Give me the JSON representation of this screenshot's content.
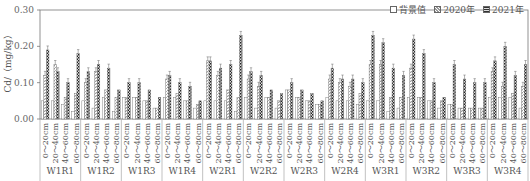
{
  "chart_data": {
    "type": "bar",
    "title": "",
    "ylabel": "Cd/（mg/kg）",
    "xlabel": "",
    "ylim": [
      0,
      0.3
    ],
    "yticks": [
      "0.00",
      "0.10",
      "0.20",
      "0.30"
    ],
    "grid": false,
    "legend_position": "top-right",
    "legend": [
      "背景值",
      "2020年",
      "2021年"
    ],
    "groups": [
      "W1R1",
      "W1R2",
      "W1R3",
      "W1R4",
      "W2R1",
      "W2R2",
      "W2R3",
      "W2R4",
      "W3R1",
      "W3R2",
      "W3R3",
      "W3R4"
    ],
    "depths": [
      "0～20cm",
      "20～40cm",
      "40～60cm",
      "60～80cm"
    ],
    "series": [
      {
        "name": "背景值",
        "values": [
          [
            0.05,
            0.05,
            0.04,
            0.02
          ],
          [
            0.05,
            0.03,
            0.06,
            0.02
          ],
          [
            0.06,
            0.06,
            0.05,
            0.03
          ],
          [
            0.06,
            0.06,
            0.05,
            0.03
          ],
          [
            0.05,
            0.05,
            0.05,
            0.02
          ],
          [
            0.06,
            0.03,
            0.06,
            0.03
          ],
          [
            0.08,
            0.06,
            0.05,
            0.04
          ],
          [
            0.06,
            0.05,
            0.05,
            0.04
          ],
          [
            0.05,
            0.05,
            0.02,
            0.03
          ],
          [
            0.06,
            0.06,
            0.05,
            0.03
          ],
          [
            0.04,
            0.03,
            0.03,
            0.03
          ],
          [
            0.06,
            0.06,
            0.06,
            0.03
          ]
        ]
      },
      {
        "name": "2020年",
        "values": [
          [
            0.12,
            0.15,
            0.06,
            0.07
          ],
          [
            0.1,
            0.13,
            0.08,
            0.06
          ],
          [
            0.06,
            0.06,
            0.05,
            0.03
          ],
          [
            0.11,
            0.07,
            0.05,
            0.04
          ],
          [
            0.16,
            0.12,
            0.08,
            0.06
          ],
          [
            0.11,
            0.09,
            0.06,
            0.05
          ],
          [
            0.08,
            0.06,
            0.05,
            0.04
          ],
          [
            0.11,
            0.1,
            0.09,
            0.07
          ],
          [
            0.15,
            0.15,
            0.06,
            0.06
          ],
          [
            0.14,
            0.06,
            0.05,
            0.05
          ],
          [
            0.04,
            0.03,
            0.03,
            0.03
          ],
          [
            0.13,
            0.09,
            0.07,
            0.09
          ]
        ]
      },
      {
        "name": "2021年",
        "values": [
          [
            0.19,
            0.13,
            0.1,
            0.18
          ],
          [
            0.13,
            0.15,
            0.14,
            0.08
          ],
          [
            0.1,
            0.1,
            0.08,
            0.06
          ],
          [
            0.12,
            0.1,
            0.09,
            0.05
          ],
          [
            0.16,
            0.14,
            0.15,
            0.23
          ],
          [
            0.13,
            0.12,
            0.08,
            0.07
          ],
          [
            0.1,
            0.08,
            0.07,
            0.05
          ],
          [
            0.14,
            0.11,
            0.11,
            0.1
          ],
          [
            0.23,
            0.21,
            0.14,
            0.12
          ],
          [
            0.22,
            0.18,
            0.1,
            0.06
          ],
          [
            0.15,
            0.11,
            0.1,
            0.1
          ],
          [
            0.16,
            0.2,
            0.12,
            0.15
          ]
        ]
      }
    ]
  },
  "axis": {
    "ylabel": "Cd/（mg/kg）"
  },
  "legend": {
    "items": [
      {
        "label": "背景值"
      },
      {
        "label": "2020年"
      },
      {
        "label": "2021年"
      }
    ]
  }
}
